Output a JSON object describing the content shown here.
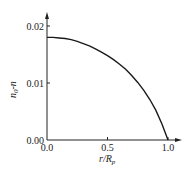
{
  "chart_data": {
    "type": "line",
    "title": "",
    "xlabel": "r/Rp",
    "xlabel_main": "r/R",
    "xlabel_sub": "p",
    "ylabel": "n0-n",
    "ylabel_main": "n",
    "ylabel_sub": "0",
    "ylabel_tail": "-n",
    "xlim": [
      0.0,
      1.0
    ],
    "ylim": [
      0.0,
      0.02
    ],
    "x_ticks": [
      "0.0",
      "0.5",
      "1.0"
    ],
    "y_ticks": [
      "0.00",
      "0.01",
      "0.02"
    ],
    "grid": false,
    "legend": null,
    "series": [
      {
        "name": "n0-n",
        "color": "#1a1a1a",
        "x": [
          0.0,
          0.05,
          0.1,
          0.15,
          0.2,
          0.25,
          0.3,
          0.35,
          0.4,
          0.45,
          0.5,
          0.55,
          0.6,
          0.65,
          0.7,
          0.75,
          0.8,
          0.85,
          0.9,
          0.95,
          1.0
        ],
        "y": [
          0.018,
          0.018,
          0.0179,
          0.0178,
          0.0176,
          0.0173,
          0.0169,
          0.0165,
          0.016,
          0.0154,
          0.0148,
          0.0141,
          0.0133,
          0.0124,
          0.0113,
          0.0101,
          0.0087,
          0.0071,
          0.0052,
          0.0028,
          0.0
        ]
      }
    ]
  }
}
